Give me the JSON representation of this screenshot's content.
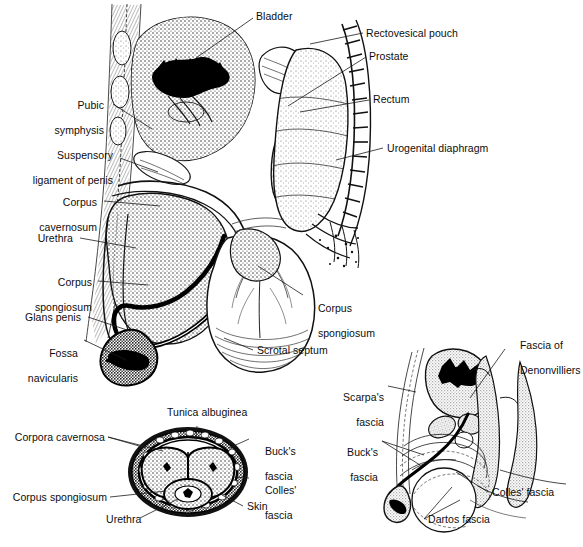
{
  "figure": {
    "background_color": "#ffffff",
    "ink_color": "#1a1a1a",
    "shade_color": "#c8c8c8",
    "width": 583,
    "height": 547
  },
  "panels": {
    "main_sagittal": {
      "name": "Midsagittal section of male pelvis and external genitalia",
      "labels_left": [
        {
          "text": "Pubic\nsymphysis",
          "line1": "Pubic",
          "line2": "symphysis"
        },
        {
          "text": "Suspensory\nligament of penis",
          "line1": "Suspensory",
          "line2": "ligament of penis"
        },
        {
          "text": "Corpus\ncavernosum",
          "line1": "Corpus",
          "line2": "cavernosum"
        },
        {
          "text": "Urethra",
          "line1": "Urethra",
          "line2": ""
        },
        {
          "text": "Corpus\nspongiosum",
          "line1": "Corpus",
          "line2": "spongiosum"
        },
        {
          "text": "Glans penis",
          "line1": "Glans penis",
          "line2": ""
        },
        {
          "text": "Fossa\nnavicularis",
          "line1": "Fossa",
          "line2": "navicularis"
        }
      ],
      "labels_top": [
        {
          "text": "Bladder"
        }
      ],
      "labels_right": [
        {
          "text": "Rectovesical pouch"
        },
        {
          "text": "Prostate"
        },
        {
          "text": "Rectum"
        },
        {
          "text": "Urogenital diaphragm"
        }
      ],
      "labels_inner": [
        {
          "text": "Corpus\nspongiosum",
          "line1": "Corpus",
          "line2": "spongiosum"
        },
        {
          "text": "Scrotal septum"
        }
      ]
    },
    "cross_section": {
      "name": "Transverse cross-section of penile shaft",
      "labels": [
        {
          "text": "Tunica albuginea",
          "position": "top"
        },
        {
          "text": "Corpora cavernosa",
          "position": "left"
        },
        {
          "text": "Corpus spongiosum",
          "position": "left"
        },
        {
          "text": "Urethra",
          "position": "bottom"
        },
        {
          "text": "Buck's\nfascia",
          "line1": "Buck's",
          "line2": "fascia",
          "position": "right"
        },
        {
          "text": "Colles'\nfascia",
          "line1": "Colles'",
          "line2": "fascia",
          "position": "right"
        },
        {
          "text": "Skin",
          "position": "right"
        }
      ]
    },
    "fascial_planes": {
      "name": "Sagittal section showing fascial planes of perineum",
      "labels": [
        {
          "text": "Fascia of\nDenonvilliers",
          "line1": "Fascia of",
          "line2": "Denonvilliers",
          "position": "top-right"
        },
        {
          "text": "Scarpa's\nfascia",
          "line1": "Scarpa's",
          "line2": "fascia",
          "position": "left"
        },
        {
          "text": "Buck's\nfascia",
          "line1": "Buck's",
          "line2": "fascia",
          "position": "left"
        },
        {
          "text": "Colles' fascia",
          "position": "bottom-right"
        },
        {
          "text": "Dartos fascia",
          "position": "bottom-right"
        }
      ]
    }
  }
}
